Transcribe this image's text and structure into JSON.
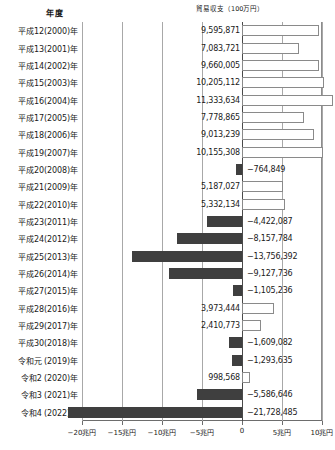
{
  "headers": {
    "year_column": "年度",
    "value_column": "貿易収支（100万円）"
  },
  "axis": {
    "ticks": [
      {
        "label": "−20兆円",
        "value": -20000000
      },
      {
        "label": "−15兆円",
        "value": -15000000
      },
      {
        "label": "−10兆円",
        "value": -10000000
      },
      {
        "label": "−5兆円",
        "value": -5000000
      },
      {
        "label": "0",
        "value": 0
      },
      {
        "label": "5兆円",
        "value": 5000000
      },
      {
        "label": "10兆円",
        "value": 10000000
      }
    ],
    "min": -20000000,
    "max": 10000000
  },
  "colors": {
    "positive_fill": "#ffffff",
    "positive_border": "#8a8a8a",
    "negative_fill": "#3f3f3f",
    "gridline": "#a8a8a8",
    "zero_line": "#4a4a4a",
    "text": "#1a1a1a"
  },
  "chart_data": {
    "type": "bar",
    "orientation": "horizontal",
    "title": "貿易収支（100万円）",
    "xlabel": "",
    "ylabel": "年度",
    "xlim": [
      -20000000,
      10000000
    ],
    "grid": true,
    "legend": null,
    "unit": "100万円",
    "categories": [
      "平成12(2000)年",
      "平成13(2001)年",
      "平成14(2002)年",
      "平成15(2003)年",
      "平成16(2004)年",
      "平成17(2005)年",
      "平成18(2006)年",
      "平成19(2007)年",
      "平成20(2008)年",
      "平成21(2009)年",
      "平成22(2010)年",
      "平成23(2011)年",
      "平成24(2012)年",
      "平成25(2013)年",
      "平成26(2014)年",
      "平成27(2015)年",
      "平成28(2016)年",
      "平成29(2017)年",
      "平成30(2018)年",
      "令和元 (2019)年",
      "令和2 (2020)年",
      "令和3 (2021)年",
      "令和4 (2022)年"
    ],
    "values": [
      9595871,
      7083721,
      9660005,
      10205112,
      11333634,
      7778865,
      9013239,
      10155308,
      -764849,
      5187027,
      5332134,
      -4422087,
      -8157784,
      -13756392,
      -9127736,
      -1105236,
      3973444,
      2410773,
      -1609082,
      -1293635,
      998568,
      -5586646,
      -21728485
    ],
    "data_labels": [
      "9,595,871",
      "7,083,721",
      "9,660,005",
      "10,205,112",
      "11,333,634",
      "7,778,865",
      "9,013,239",
      "10,155,308",
      "−764,849",
      "5,187,027",
      "5,332,134",
      "−4,422,087",
      "−8,157,784",
      "−13,756,392",
      "−9,127,736",
      "−1,105,236",
      "3,973,444",
      "2,410,773",
      "−1,609,082",
      "−1,293,635",
      "998,568",
      "−5,586,646",
      "−21,728,485"
    ]
  }
}
